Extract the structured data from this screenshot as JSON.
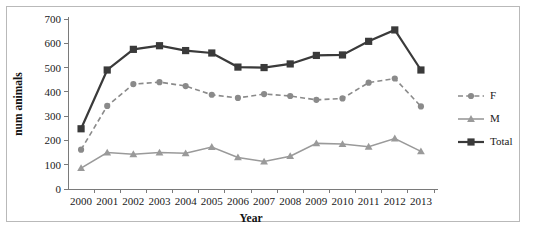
{
  "chart_data": {
    "type": "line",
    "title": "",
    "xlabel": "Year",
    "ylabel": "num animals",
    "categories": [
      "2000",
      "2001",
      "2002",
      "2003",
      "2004",
      "2005",
      "2006",
      "2007",
      "2008",
      "2009",
      "2010",
      "2011",
      "2012",
      "2013"
    ],
    "ylim": [
      0,
      700
    ],
    "yticks": [
      0,
      100,
      200,
      300,
      400,
      500,
      600,
      700
    ],
    "ytick_labels": [
      "0",
      "100",
      "200",
      "300",
      "400",
      "500",
      "600",
      "700"
    ],
    "grid": false,
    "legend_position": "right",
    "series": [
      {
        "name": "F",
        "color": "#8a8a8a",
        "marker": "circle",
        "dash": "dashed",
        "values": [
          162,
          342,
          432,
          440,
          424,
          388,
          375,
          391,
          383,
          367,
          373,
          438,
          455,
          340
        ]
      },
      {
        "name": "M",
        "color": "#9a9a9a",
        "marker": "triangle",
        "dash": "solid",
        "values": [
          86,
          150,
          143,
          150,
          147,
          173,
          130,
          113,
          135,
          188,
          185,
          174,
          208,
          155
        ]
      },
      {
        "name": "Total",
        "color": "#3a3a3a",
        "marker": "square",
        "dash": "solid",
        "values": [
          248,
          490,
          575,
          590,
          570,
          560,
          502,
          500,
          515,
          550,
          552,
          608,
          655,
          490
        ]
      }
    ]
  },
  "figure": {
    "border_color": "#b9b9b9",
    "background": "#ffffff",
    "axis_color": "#7a7a7a"
  }
}
